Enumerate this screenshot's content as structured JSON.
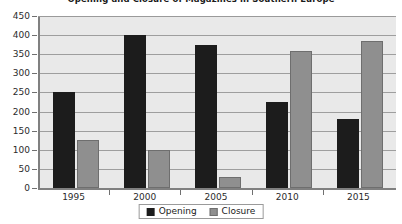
{
  "chart_data": {
    "type": "bar",
    "title": "Opening and Closure of Magazines in Southern Europe",
    "xlabel": "",
    "ylabel": "",
    "categories": [
      "1995",
      "2000",
      "2005",
      "2010",
      "2015"
    ],
    "series": [
      {
        "name": "Opening",
        "color": "#1c1c1c",
        "values": [
          250,
          400,
          375,
          225,
          180
        ]
      },
      {
        "name": "Closure",
        "color": "#8f8f8f",
        "values": [
          125,
          100,
          30,
          358,
          385
        ]
      }
    ],
    "ylim": [
      0,
      450
    ],
    "ytick_step": 50,
    "yticks": [
      0,
      50,
      100,
      150,
      200,
      250,
      300,
      350,
      400,
      450
    ],
    "ytick_labels": [
      "0",
      "50",
      "100",
      "150",
      "200",
      "250",
      "300",
      "350",
      "400",
      "450"
    ],
    "grid": true,
    "grid_axis": "y",
    "legend": true,
    "legend_position": "bottom",
    "plot_background": "#e9e9e9",
    "gridline_color": "#9e9e9e",
    "axis_color": "#808080"
  }
}
